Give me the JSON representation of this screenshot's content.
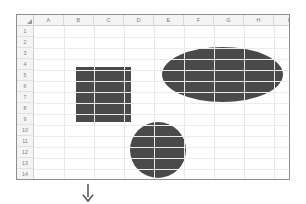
{
  "app": {
    "type": "spreadsheet",
    "background_color": "#ffffff"
  },
  "sheet": {
    "name": "grid",
    "select_all_icon": "select-all-triangle-icon",
    "column_headers": [
      "A",
      "B",
      "C",
      "D",
      "E",
      "F",
      "G",
      "H",
      "I"
    ],
    "row_headers": [
      "1",
      "2",
      "3",
      "4",
      "5",
      "6",
      "7",
      "8",
      "9",
      "10",
      "11",
      "12",
      "13",
      "14",
      "15"
    ],
    "gridline_color": "#e8e8e8",
    "header_background": "#f4f4f4",
    "header_text_color": "#7c7c7c",
    "border_color": "#8e8e8e",
    "cells": []
  },
  "shapes": [
    {
      "id": "rectangle",
      "label": "rectangle-shape",
      "kind": "rectangle",
      "fill": "#4a4a4a",
      "anchor_cells": "B3:C8"
    },
    {
      "id": "ellipse",
      "label": "ellipse-shape",
      "kind": "ellipse",
      "fill": "#4a4a4a",
      "anchor_cells": "E2:H6"
    },
    {
      "id": "circle",
      "label": "circle-shape",
      "kind": "circle",
      "fill": "#4a4a4a",
      "anchor_cells": "D9:E13"
    }
  ],
  "annotation": {
    "arrow_icon": "arrow-down-icon",
    "arrow_color": "#5b5b5b",
    "arrow_glyph": "↓"
  }
}
